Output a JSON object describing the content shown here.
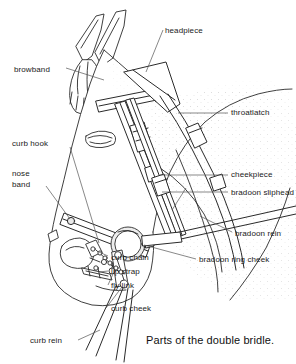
{
  "figure": {
    "title": "Parts of the double bridle",
    "caption": "Parts of the double bridle.",
    "background_color": "#ffffff",
    "line_color": "#222222",
    "text_color": "#1a1a1a",
    "width": 296,
    "height": 364
  },
  "labels": {
    "headpiece": "headpiece",
    "browband": "browband",
    "throatlatch": "throatlatch",
    "curb_hook": "curb hook",
    "nose_band_line1": "nose",
    "nose_band_line2": "band",
    "cheekpiece": "cheekpiece",
    "bradoon_sliphead": "bradoon sliphead",
    "bradoon_rein": "bradoon rein",
    "bradoon_ring_cheek": "bradoon ring cheek",
    "curb_chain": "curb chain",
    "lip_strap": "lip strap",
    "fly_link": "fly link",
    "curb_cheek": "curb cheek",
    "curb_rein": "curb rein"
  }
}
